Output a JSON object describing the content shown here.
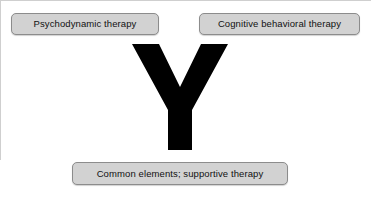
{
  "figure": {
    "type": "branching-diagram",
    "background_color": "#ffffff",
    "connector": {
      "name": "y-branch",
      "shape": "Y",
      "color": "#000000"
    },
    "node_style": {
      "fill": "#d2d2d2",
      "border": "#8c8c8c",
      "text": "#111111"
    },
    "nodes": [
      {
        "id": "psychodynamic",
        "label": "Psychodynamic therapy",
        "position": "top-left"
      },
      {
        "id": "cognitive-behavioral",
        "label": "Cognitive behavioral therapy",
        "position": "top-right"
      },
      {
        "id": "common-elements",
        "label": "Common elements; supportive therapy",
        "position": "bottom-center"
      }
    ]
  }
}
